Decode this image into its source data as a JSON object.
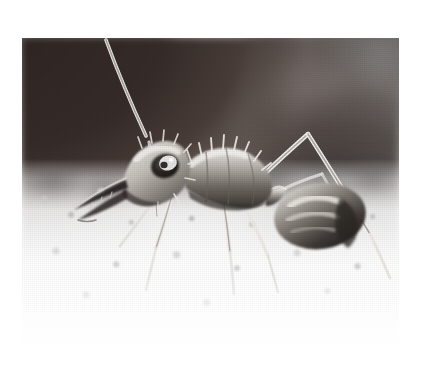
{
  "page": {
    "background_color": "#ffffff",
    "width": 421,
    "height": 389
  },
  "photo": {
    "name": "ant-photograph",
    "caption": "",
    "alt_text": "Black and white close-up photograph of an ant standing on pale gravel",
    "type": "grayscale photograph",
    "left": 22,
    "top": 38,
    "width": 377,
    "height": 318,
    "subject": "ant",
    "subject_detail": "bull ant in profile facing left, long antenna sweeping up to the left, large compound eye, elongated mandibles, spined thorax, rounded gaster",
    "colors": {
      "page_background": "#ffffff",
      "photo_dark": "#2e2523",
      "photo_midtone": "#8a8a8a",
      "photo_light": "#ffffff",
      "ant_body": "#5c5853",
      "ant_highlight": "#e8e6e2",
      "eye_dark": "#221d1b",
      "eye_highlight": "#ffffff"
    },
    "regions": [
      {
        "name": "upper-left-dark-mass",
        "tone": "very dark brown-black",
        "description": "out of focus shadow / rock occupying the upper left"
      },
      {
        "name": "upper-background-blur",
        "tone": "light grey with white streaks",
        "description": "blurred vertical stems and light gaps across the top centre"
      },
      {
        "name": "right-dark-blob",
        "tone": "dark grey",
        "description": "out of focus dark mass behind the ant's gaster"
      },
      {
        "name": "ground-gravel",
        "tone": "near white",
        "description": "bright out-of-focus sand and gravel filling the lower half"
      }
    ],
    "anatomy": [
      {
        "name": "antenna",
        "description": "long scape curving up and to the left from the head, exiting the top of the frame"
      },
      {
        "name": "head",
        "description": "elongated head in left profile covered with fine hairs"
      },
      {
        "name": "compound-eye",
        "description": "large dark oval eye with a bright specular highlight"
      },
      {
        "name": "mandibles",
        "description": "long slender toothed mandibles pointing down and left"
      },
      {
        "name": "thorax",
        "description": "segmented mesosoma with erect spines along the dorsum"
      },
      {
        "name": "petiole",
        "description": "narrow waist node between thorax and gaster"
      },
      {
        "name": "gaster",
        "description": "rounded shining abdomen with pale banded highlights"
      },
      {
        "name": "front-leg",
        "description": "foreleg angled down-left to the gravel"
      },
      {
        "name": "middle-leg",
        "description": "mid leg descending vertically into the gravel"
      },
      {
        "name": "hind-leg",
        "description": "long hind leg forming a tall inverted V on the right"
      }
    ]
  }
}
